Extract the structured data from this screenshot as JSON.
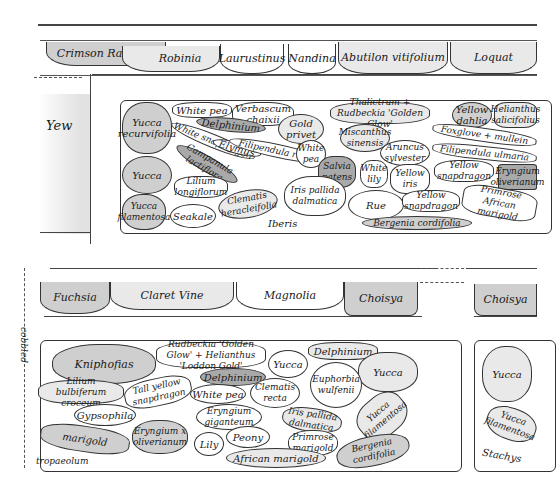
{
  "plan": {
    "type": "hand-drawn garden planting plan",
    "top_border": {
      "shrubs": [
        "Crimson Rambler",
        "Robinia",
        "Laurustinus",
        "Nandina",
        "Abutilon vitifolium",
        "Loquat"
      ]
    },
    "left_area": {
      "label": "Yew"
    },
    "upper_bed": {
      "plants": [
        {
          "id": "p1",
          "label": "Yucca recurvifolia"
        },
        {
          "id": "p2",
          "label": "White pea"
        },
        {
          "id": "p3",
          "label": "Verbascum chaixii"
        },
        {
          "id": "p4",
          "label": "Delphinium"
        },
        {
          "id": "p5",
          "label": "Gold privet"
        },
        {
          "id": "p6",
          "label": "Thalictrum + Rudbeckia 'Golden Glow'"
        },
        {
          "id": "p7",
          "label": "Yellow dahlia"
        },
        {
          "id": "p8",
          "label": "Helianthus salicifolius"
        },
        {
          "id": "p9",
          "label": "White snapdragon"
        },
        {
          "id": "p10",
          "label": "Elymus"
        },
        {
          "id": "p11",
          "label": "Filipendula rubra"
        },
        {
          "id": "p12",
          "label": "White pea"
        },
        {
          "id": "p13",
          "label": "Miscanthus sinensis"
        },
        {
          "id": "p14",
          "label": "Foxglove + mullein"
        },
        {
          "id": "p15",
          "label": "Campanula lactiflora"
        },
        {
          "id": "p16",
          "label": "Aruncus sylvester"
        },
        {
          "id": "p17",
          "label": "Filipendula ulmaria"
        },
        {
          "id": "p18",
          "label": "Yucca"
        },
        {
          "id": "p19",
          "label": "Salvia patens"
        },
        {
          "id": "p20",
          "label": "White lily"
        },
        {
          "id": "p21",
          "label": "Yellow iris"
        },
        {
          "id": "p22",
          "label": "Yellow snapdragon"
        },
        {
          "id": "p23",
          "label": "Eryngium oliverianum"
        },
        {
          "id": "p24",
          "label": "Lilium longiflorum"
        },
        {
          "id": "p25",
          "label": "Clematis heracleifolia"
        },
        {
          "id": "p26",
          "label": "Iris pallida dalmatica"
        },
        {
          "id": "p27",
          "label": "Rue"
        },
        {
          "id": "p28",
          "label": "Yellow snapdragon"
        },
        {
          "id": "p29",
          "label": "Primrose African marigold"
        },
        {
          "id": "p30",
          "label": "Yucca filamentosa"
        },
        {
          "id": "p31",
          "label": "Seakale"
        },
        {
          "id": "p32",
          "label": "Iberis"
        },
        {
          "id": "p33",
          "label": "Bergenia cordifolia"
        }
      ]
    },
    "middle_border": {
      "shrubs": [
        "Fuchsia",
        "Claret Vine",
        "Magnolia",
        "Choisya"
      ],
      "right_shrub": "Choisya"
    },
    "side_label": "cobbled",
    "lower_bed": {
      "plants": [
        {
          "id": "q1",
          "label": "Kniphofias"
        },
        {
          "id": "q2",
          "label": "Rudbeckia 'Golden Glow' + Helianthus 'Loddon Gold'"
        },
        {
          "id": "q3",
          "label": "Delphinium"
        },
        {
          "id": "q4",
          "label": "Yucca"
        },
        {
          "id": "q5",
          "label": "Yucca"
        },
        {
          "id": "q6",
          "label": "Lilium bulbiferum croceum"
        },
        {
          "id": "q7",
          "label": "Tall yellow snapdragon"
        },
        {
          "id": "q8",
          "label": "Delphinium"
        },
        {
          "id": "q9",
          "label": "White pea"
        },
        {
          "id": "q10",
          "label": "Clematis recta"
        },
        {
          "id": "q11",
          "label": "Euphorbia wulfenii"
        },
        {
          "id": "q12",
          "label": "Gypsophila"
        },
        {
          "id": "q13",
          "label": "Eryngium giganteum"
        },
        {
          "id": "q14",
          "label": "Iris pallida dalmatica"
        },
        {
          "id": "q15",
          "label": "Yucca filamentosa"
        },
        {
          "id": "q16",
          "label": "marigold"
        },
        {
          "id": "q17",
          "label": "Eryngium x oliverianum"
        },
        {
          "id": "q18",
          "label": "Lily"
        },
        {
          "id": "q19",
          "label": "Peony"
        },
        {
          "id": "q20",
          "label": "Primrose marigold"
        },
        {
          "id": "q21",
          "label": "tropaeolum"
        },
        {
          "id": "q22",
          "label": "African marigold"
        },
        {
          "id": "q23",
          "label": "Bergenia cordifolia"
        }
      ]
    },
    "lower_right_bed": {
      "plants": [
        {
          "id": "r1",
          "label": "Yucca"
        },
        {
          "id": "r2",
          "label": "Yucca filamentosa"
        },
        {
          "id": "r3",
          "label": "Stachys"
        }
      ]
    }
  },
  "colors": {
    "ink": "#333333",
    "wash_light": "#e9e9e9",
    "wash_mid": "#cfcfcf",
    "wash_dark": "#a9a9a9"
  }
}
